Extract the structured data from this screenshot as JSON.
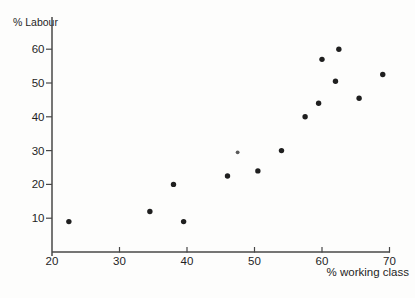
{
  "figure": {
    "ylabel": "% Labour",
    "xlabel": "% working class"
  },
  "colors": {
    "background": "#fdfdfc",
    "axis": "#474747",
    "text": "#1f1f1f",
    "dot": "#1f1f1f",
    "dot_small": "#5a5a5a"
  },
  "chart_data": {
    "type": "scatter",
    "title": "",
    "xlabel": "% working class",
    "ylabel": "% Labour",
    "xlim": [
      20,
      70
    ],
    "ylim": [
      0,
      65
    ],
    "x_ticks": [
      20,
      30,
      40,
      50,
      60,
      70
    ],
    "y_ticks": [
      10,
      20,
      30,
      40,
      50,
      60
    ],
    "grid": false,
    "legend": "none",
    "points": [
      {
        "x": 22.5,
        "y": 9
      },
      {
        "x": 34.5,
        "y": 12
      },
      {
        "x": 38,
        "y": 20
      },
      {
        "x": 39.5,
        "y": 9
      },
      {
        "x": 46,
        "y": 22.5
      },
      {
        "x": 47.5,
        "y": 29.5,
        "size": "small"
      },
      {
        "x": 50.5,
        "y": 24
      },
      {
        "x": 54,
        "y": 30
      },
      {
        "x": 57.5,
        "y": 40
      },
      {
        "x": 59.5,
        "y": 44
      },
      {
        "x": 60,
        "y": 57
      },
      {
        "x": 62,
        "y": 50.5
      },
      {
        "x": 62.5,
        "y": 60
      },
      {
        "x": 65.5,
        "y": 45.5
      },
      {
        "x": 69,
        "y": 52.5
      }
    ]
  }
}
